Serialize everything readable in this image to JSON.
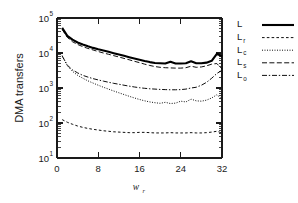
{
  "chart_data": {
    "type": "line",
    "title": "",
    "xlabel": "w_r",
    "xlabel_main": "w",
    "xlabel_sub": "r",
    "ylabel": "DMA transfers",
    "yscale": "log",
    "xlim": [
      0,
      32
    ],
    "ylim": [
      10,
      100000
    ],
    "grid": false,
    "legend_position": "right-outside",
    "xticks": [
      0,
      8,
      16,
      24,
      32
    ],
    "xtick_labels": [
      "0",
      "8",
      "16",
      "24",
      "32"
    ],
    "yticks": [
      10,
      100,
      1000,
      10000,
      100000
    ],
    "ytick_labels": [
      "10",
      "10",
      "10",
      "10",
      "10"
    ],
    "ytick_exponents": [
      "1",
      "2",
      "3",
      "4",
      "5"
    ],
    "series": [
      {
        "name": "L",
        "label_main": "L",
        "label_sub": "",
        "style": "solid",
        "x": [
          1,
          2,
          3,
          4,
          5,
          6,
          7,
          8,
          9,
          10,
          11,
          12,
          13,
          14,
          15,
          16,
          17,
          18,
          19,
          20,
          21,
          22,
          23,
          24,
          25,
          26,
          27,
          28,
          29,
          30,
          31,
          32
        ],
        "values": [
          52000,
          31000,
          24000,
          20000,
          17500,
          15500,
          14000,
          12800,
          11800,
          10800,
          9900,
          9100,
          8300,
          7600,
          7000,
          6400,
          5900,
          5500,
          5200,
          5100,
          5000,
          5600,
          5000,
          5000,
          5100,
          5800,
          5100,
          5100,
          5300,
          6000,
          9500,
          8000
        ]
      },
      {
        "name": "L_r",
        "label_main": "L",
        "label_sub": "r",
        "style": "dashed",
        "x": [
          1,
          2,
          3,
          4,
          5,
          6,
          7,
          8,
          9,
          10,
          11,
          12,
          13,
          14,
          15,
          16,
          17,
          18,
          19,
          20,
          21,
          22,
          23,
          24,
          25,
          26,
          27,
          28,
          29,
          30,
          31,
          32
        ],
        "values": [
          125,
          105,
          92,
          82,
          75,
          70,
          66,
          63,
          60,
          58,
          56,
          55,
          54,
          53,
          53,
          54,
          54,
          53,
          52,
          52,
          52,
          53,
          52,
          52,
          52,
          53,
          52,
          52,
          53,
          55,
          58,
          52
        ]
      },
      {
        "name": "L_c",
        "label_main": "L",
        "label_sub": "c",
        "style": "dotted",
        "x": [
          1,
          2,
          3,
          4,
          5,
          6,
          7,
          8,
          9,
          10,
          11,
          12,
          13,
          14,
          15,
          16,
          17,
          18,
          19,
          20,
          21,
          22,
          23,
          24,
          25,
          26,
          27,
          28,
          29,
          30,
          31,
          32
        ],
        "values": [
          8500,
          4300,
          3000,
          2300,
          1900,
          1600,
          1380,
          1200,
          1050,
          930,
          820,
          730,
          650,
          580,
          520,
          470,
          430,
          400,
          380,
          365,
          390,
          360,
          370,
          420,
          400,
          480,
          430,
          420,
          450,
          520,
          640,
          480
        ]
      },
      {
        "name": "L_s",
        "label_main": "L",
        "label_sub": "s",
        "style": "dashed-long",
        "x": [
          1,
          2,
          3,
          4,
          5,
          6,
          7,
          8,
          9,
          10,
          11,
          12,
          13,
          14,
          15,
          16,
          17,
          18,
          19,
          20,
          21,
          22,
          23,
          24,
          25,
          26,
          27,
          28,
          29,
          30,
          31,
          32
        ],
        "values": [
          47000,
          28000,
          21000,
          17500,
          15200,
          13500,
          12200,
          11000,
          10000,
          9200,
          8400,
          7700,
          7000,
          6400,
          5800,
          5300,
          4800,
          4400,
          4100,
          3900,
          3800,
          3750,
          3700,
          3700,
          3800,
          4200,
          3900,
          4000,
          4300,
          4800,
          5000,
          3500
        ]
      },
      {
        "name": "L_o",
        "label_main": "L",
        "label_sub": "o",
        "style": "dash-dot",
        "x": [
          1,
          2,
          3,
          4,
          5,
          6,
          7,
          8,
          9,
          10,
          11,
          12,
          13,
          14,
          15,
          16,
          17,
          18,
          19,
          20,
          21,
          22,
          23,
          24,
          25,
          26,
          27,
          28,
          29,
          30,
          31,
          32
        ],
        "values": [
          8200,
          4500,
          3300,
          2700,
          2300,
          2050,
          1850,
          1700,
          1570,
          1460,
          1360,
          1280,
          1200,
          1130,
          1070,
          1020,
          980,
          950,
          930,
          910,
          900,
          890,
          890,
          900,
          930,
          1000,
          1050,
          1200,
          1450,
          1900,
          2600,
          3200
        ]
      }
    ]
  },
  "legend": {
    "entries": [
      {
        "label_main": "L",
        "label_sub": "",
        "style": "solid"
      },
      {
        "label_main": "L",
        "label_sub": "r",
        "style": "dashed"
      },
      {
        "label_main": "L",
        "label_sub": "c",
        "style": "dotted"
      },
      {
        "label_main": "L",
        "label_sub": "s",
        "style": "dashed-long"
      },
      {
        "label_main": "L",
        "label_sub": "o",
        "style": "dash-dot"
      }
    ]
  },
  "colors": {
    "axis": "#1a1a1a",
    "curve": "#000000",
    "background": "#ffffff"
  }
}
